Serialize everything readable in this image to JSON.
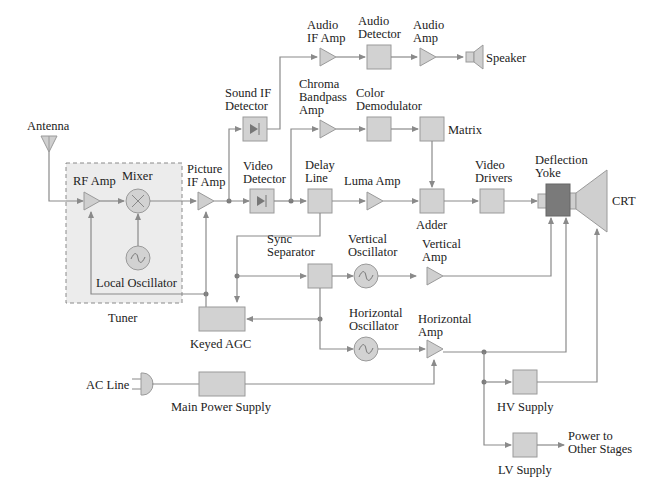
{
  "diagram": {
    "blocks": {
      "antenna": "Antenna",
      "rf_amp": "RF Amp",
      "mixer": "Mixer",
      "local_oscillator": "Local Oscillator",
      "tuner": "Tuner",
      "picture_if_amp_1": "Picture",
      "picture_if_amp_2": "IF Amp",
      "sound_if_detector_1": "Sound IF",
      "sound_if_detector_2": "Detector",
      "audio_if_amp_1": "Audio",
      "audio_if_amp_2": "IF Amp",
      "audio_detector_1": "Audio",
      "audio_detector_2": "Detector",
      "audio_amp_1": "Audio",
      "audio_amp_2": "Amp",
      "speaker": "Speaker",
      "chroma_1": "Chroma",
      "chroma_2": "Bandpass",
      "chroma_3": "Amp",
      "color_demod_1": "Color",
      "color_demod_2": "Demodulator",
      "matrix": "Matrix",
      "video_detector_1": "Video",
      "video_detector_2": "Detector",
      "delay_line_1": "Delay",
      "delay_line_2": "Line",
      "luma_amp": "Luma Amp",
      "adder": "Adder",
      "video_drivers_1": "Video",
      "video_drivers_2": "Drivers",
      "deflection_yoke_1": "Deflection",
      "deflection_yoke_2": "Yoke",
      "crt": "CRT",
      "sync_separator_1": "Sync",
      "sync_separator_2": "Separator",
      "vertical_osc_1": "Vertical",
      "vertical_osc_2": "Oscillator",
      "vertical_amp_1": "Vertical",
      "vertical_amp_2": "Amp",
      "keyed_agc": "Keyed AGC",
      "horizontal_osc_1": "Horizontal",
      "horizontal_osc_2": "Oscillator",
      "horizontal_amp_1": "Horizontal",
      "horizontal_amp_2": "Amp",
      "ac_line": "AC Line",
      "main_power_supply": "Main Power Supply",
      "hv_supply": "HV Supply",
      "lv_supply": "LV Supply",
      "power_out_1": "Power to",
      "power_out_2": "Other Stages"
    },
    "colors": {
      "block_fill": "#d2d2d2",
      "yoke_fill": "#7a7a7a",
      "tuner_fill": "#ececec",
      "wire": "#8a8a8a"
    }
  }
}
